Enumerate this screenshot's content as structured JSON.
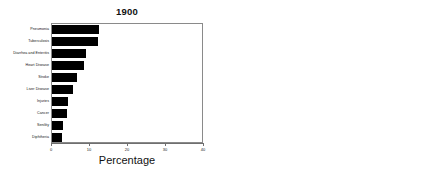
{
  "chart_data": [
    {
      "type": "bar",
      "orientation": "horizontal",
      "title": "1900",
      "xlabel": "Percentage",
      "ylabel": "",
      "xlim": [
        0,
        40
      ],
      "xticks": [
        0,
        10,
        20,
        30,
        40
      ],
      "xtick_labels": [
        "0",
        "10",
        "20",
        "30",
        "40"
      ],
      "grid": false,
      "legend": "none",
      "bar_color": "#000000",
      "categories": [
        "Pneumonia",
        "Tuberculosis",
        "Diarrhea and Enteritis",
        "Heart Disease",
        "Stroke",
        "Liver Disease",
        "Injuries",
        "Cancer",
        "Senility",
        "Diphtheria"
      ],
      "values": [
        12.4,
        12.0,
        9.0,
        8.5,
        6.5,
        5.5,
        4.3,
        4.0,
        3.0,
        2.5
      ]
    },
    {
      "type": "bar",
      "orientation": "horizontal",
      "title": "1997",
      "xlabel": "Percentage",
      "ylabel": "",
      "xlim": [
        0,
        40
      ],
      "xticks": [
        0,
        10,
        20,
        30,
        40
      ],
      "xtick_labels": [
        "0",
        "10",
        "20",
        "30",
        "40"
      ],
      "grid": false,
      "legend": "none",
      "bar_color": "#000000",
      "categories": [
        "Heart Disease",
        "Cancer",
        "Stroke",
        "Chronic Lung Disease",
        "Unintentional Injury",
        "Pneumonia and Influenza",
        "Diabetes",
        "HIV Infection",
        "Suicide",
        "Chronic Liver Disease"
      ],
      "values": [
        31.5,
        23.5,
        6.8,
        4.6,
        4.0,
        3.7,
        2.6,
        1.2,
        1.3,
        1.1
      ]
    }
  ]
}
